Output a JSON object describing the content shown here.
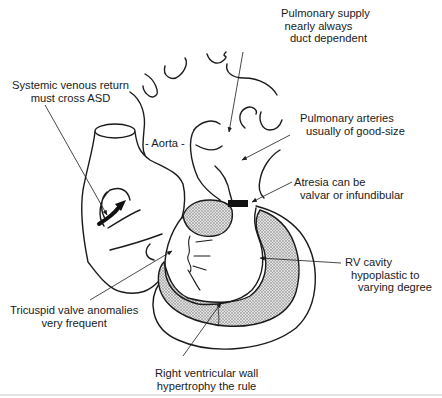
{
  "diagram": {
    "labels": {
      "pulmonary_supply": [
        "Pulmonary supply",
        "nearly always",
        "duct dependent"
      ],
      "systemic_venous": [
        "Systemic venous return",
        "must cross ASD"
      ],
      "aorta": "- Aorta -",
      "pulmonary_arteries": [
        "Pulmonary arteries",
        "usually of good-size"
      ],
      "atresia": [
        "Atresia can be",
        "valvar or infundibular"
      ],
      "rv_cavity": [
        "RV cavity",
        "hypoplastic to",
        "varying degree"
      ],
      "tricuspid": [
        "Tricuspid valve anomalies",
        "very frequent"
      ],
      "rv_wall": [
        "Right ventricular wall",
        "hypertrophy the rule"
      ]
    },
    "colors": {
      "line": "#1a1a1a",
      "stipple": "#b8b8b8",
      "background": "#ffffff"
    }
  }
}
